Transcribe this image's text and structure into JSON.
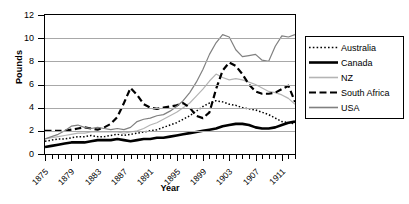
{
  "chart_data": {
    "type": "line",
    "title": "",
    "xlabel": "Year",
    "ylabel": "Pounds",
    "xlim": [
      1875,
      1913
    ],
    "ylim": [
      0,
      12
    ],
    "ytick_values": [
      0,
      2,
      4,
      6,
      8,
      10,
      12
    ],
    "xtick_labels": [
      "1875",
      "1879",
      "1883",
      "1887",
      "1891",
      "1895",
      "1899",
      "1903",
      "1907",
      "1911"
    ],
    "xtick_values": [
      1875,
      1879,
      1883,
      1887,
      1891,
      1895,
      1899,
      1903,
      1907,
      1911
    ],
    "grid": "horizontal",
    "legend_position": "right",
    "x": [
      1875,
      1876,
      1877,
      1878,
      1879,
      1880,
      1881,
      1882,
      1883,
      1884,
      1885,
      1886,
      1887,
      1888,
      1889,
      1890,
      1891,
      1892,
      1893,
      1894,
      1895,
      1896,
      1897,
      1898,
      1899,
      1900,
      1901,
      1902,
      1903,
      1904,
      1905,
      1906,
      1907,
      1908,
      1909,
      1910,
      1911,
      1912,
      1913
    ],
    "series": [
      {
        "name": "Australia",
        "style": "dotted",
        "color": "#000000",
        "values": [
          1.1,
          1.2,
          1.3,
          1.3,
          1.4,
          1.5,
          1.5,
          1.6,
          1.5,
          1.5,
          1.6,
          1.7,
          1.6,
          1.7,
          1.8,
          1.9,
          2.0,
          2.1,
          2.3,
          2.5,
          2.7,
          3.0,
          3.3,
          3.7,
          4.1,
          4.4,
          4.6,
          4.5,
          4.3,
          4.2,
          4.0,
          3.9,
          3.8,
          3.6,
          3.4,
          3.1,
          2.8,
          2.7,
          2.6
        ]
      },
      {
        "name": "Canada",
        "style": "solid-thick",
        "color": "#000000",
        "values": [
          0.6,
          0.7,
          0.8,
          0.9,
          1.0,
          1.0,
          1.0,
          1.1,
          1.2,
          1.2,
          1.2,
          1.3,
          1.2,
          1.1,
          1.2,
          1.3,
          1.3,
          1.4,
          1.4,
          1.5,
          1.6,
          1.7,
          1.8,
          1.9,
          2.0,
          2.1,
          2.2,
          2.4,
          2.5,
          2.6,
          2.6,
          2.5,
          2.3,
          2.2,
          2.2,
          2.3,
          2.5,
          2.7,
          2.8
        ]
      },
      {
        "name": "NZ",
        "style": "solid-light",
        "color": "#b4b4b4",
        "values": [
          1.3,
          1.4,
          1.5,
          1.6,
          1.7,
          1.8,
          1.8,
          1.9,
          1.9,
          1.9,
          1.9,
          1.9,
          1.8,
          1.9,
          2.0,
          2.2,
          2.5,
          2.7,
          3.0,
          3.3,
          3.6,
          4.0,
          4.4,
          5.0,
          5.6,
          6.3,
          6.9,
          6.6,
          6.4,
          6.5,
          6.4,
          6.2,
          6.0,
          5.7,
          5.4,
          5.3,
          5.1,
          4.8,
          4.3
        ]
      },
      {
        "name": "South Africa",
        "style": "dashed",
        "color": "#000000",
        "values": [
          2.0,
          2.0,
          2.0,
          2.0,
          2.1,
          2.2,
          2.3,
          2.2,
          2.1,
          2.3,
          2.6,
          3.2,
          4.4,
          5.7,
          5.1,
          4.3,
          4.0,
          3.9,
          4.0,
          4.1,
          4.2,
          4.4,
          4.0,
          3.3,
          3.1,
          3.6,
          5.6,
          7.2,
          7.9,
          7.6,
          6.9,
          6.0,
          5.4,
          5.2,
          5.2,
          5.3,
          5.6,
          5.9,
          4.5
        ]
      },
      {
        "name": "USA",
        "style": "solid-medium",
        "color": "#808080",
        "values": [
          1.3,
          1.5,
          1.7,
          2.0,
          2.4,
          2.5,
          2.3,
          2.2,
          2.3,
          2.2,
          2.1,
          2.2,
          2.1,
          2.3,
          2.8,
          3.0,
          3.1,
          3.3,
          3.4,
          3.7,
          4.1,
          4.6,
          5.3,
          6.2,
          7.3,
          8.6,
          9.6,
          10.3,
          10.1,
          9.0,
          8.4,
          8.5,
          8.6,
          8.1,
          8.0,
          9.3,
          10.2,
          10.1,
          10.3
        ]
      }
    ]
  },
  "legend": {
    "items": [
      {
        "label": "Australia"
      },
      {
        "label": "Canada"
      },
      {
        "label": "NZ"
      },
      {
        "label": "South Africa"
      },
      {
        "label": "USA"
      }
    ]
  }
}
